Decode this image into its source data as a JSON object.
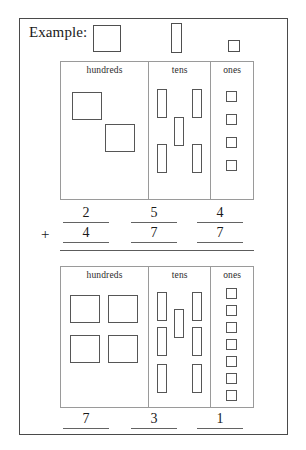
{
  "worksheet": {
    "example_label": "Example:",
    "plus_symbol": "+",
    "legend": [
      {
        "name": "hundred-block",
        "meaning": "hundreds"
      },
      {
        "name": "ten-block",
        "meaning": "tens"
      },
      {
        "name": "one-block",
        "meaning": "ones"
      }
    ],
    "columns": {
      "hundreds": "hundreds",
      "tens": "tens",
      "ones": "ones"
    },
    "top_table": {
      "hundreds_count": 2,
      "tens_count": 5,
      "ones_count": 4,
      "value": 254
    },
    "bottom_table": {
      "hundreds_count": 4,
      "tens_count": 7,
      "ones_count": 7,
      "value": 477
    },
    "addend1": {
      "hundreds": "2",
      "tens": "5",
      "ones": "4"
    },
    "addend2": {
      "hundreds": "4",
      "tens": "7",
      "ones": "7"
    },
    "answer": {
      "hundreds": "7",
      "tens": "3",
      "ones": "1"
    },
    "colors": {
      "frame": "#4a4a4a",
      "block_outline": "#565656",
      "table_rule": "#9a9a9a",
      "text": "#1a1a1a",
      "paper": "#ffffff"
    }
  }
}
